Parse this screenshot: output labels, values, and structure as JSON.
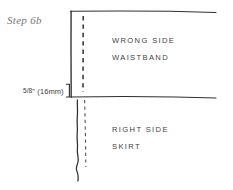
{
  "figure": {
    "title": "Step 6b",
    "background_color": "#ffffff",
    "ink_color": "#2f2f2f",
    "label_color": "#3f3f3f",
    "step_label_color": "#777777"
  },
  "labels": {
    "step": "Step 6b",
    "measurement": "5/8\" (16mm)",
    "measurement_fraction": "5/8",
    "measurement_rest": "\" (16mm)",
    "wrong_side": "WRONG SIDE",
    "waistband": "WAISTBAND",
    "right_side": "RIGHT SIDE",
    "skirt": "SKIRT"
  },
  "geometry": {
    "fold_line": {
      "x": 71,
      "y_top": 11,
      "y_bottom": 97
    },
    "top_edge": {
      "y": 11,
      "x_start": 70,
      "x_end": 216
    },
    "seam_edge": {
      "y": 97,
      "x_start": 70,
      "x_end": 216
    },
    "upper_stitch_line": {
      "x": 83,
      "y_top": 16,
      "y_bottom": 92
    },
    "lower_stitch_line": {
      "x": 85,
      "y_top": 100,
      "y_bottom": 167
    },
    "raw_edge": {
      "x": 78,
      "y_top": 100,
      "y_bottom": 181
    },
    "bracket": {
      "x": 69,
      "y_top": 84,
      "y_bottom": 97
    }
  }
}
